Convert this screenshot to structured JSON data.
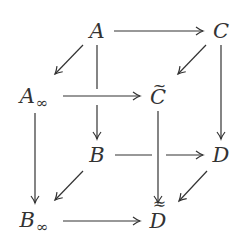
{
  "diagram": {
    "type": "commutative-cube",
    "nodes": {
      "A": {
        "label": "A",
        "x": 97,
        "y": 31
      },
      "C": {
        "label": "C",
        "x": 221,
        "y": 31
      },
      "A_inf": {
        "label": "A",
        "sub": "∞",
        "x": 32,
        "y": 96
      },
      "C_tilde": {
        "label": "C",
        "tilde": "~",
        "x": 158,
        "y": 96
      },
      "B": {
        "label": "B",
        "x": 97,
        "y": 155
      },
      "D": {
        "label": "D",
        "x": 221,
        "y": 155
      },
      "B_inf": {
        "label": "B",
        "sub": "∞",
        "x": 32,
        "y": 219
      },
      "D_tilde": {
        "label": "D",
        "tilde": "≈",
        "x": 158,
        "y": 219
      }
    },
    "edges": [
      {
        "from": "A",
        "to": "C"
      },
      {
        "from": "A",
        "to": "A_inf"
      },
      {
        "from": "A",
        "to": "B"
      },
      {
        "from": "C",
        "to": "C_tilde"
      },
      {
        "from": "C",
        "to": "D"
      },
      {
        "from": "A_inf",
        "to": "C_tilde"
      },
      {
        "from": "A_inf",
        "to": "B_inf"
      },
      {
        "from": "C_tilde",
        "to": "D_tilde"
      },
      {
        "from": "B",
        "to": "D"
      },
      {
        "from": "B",
        "to": "B_inf"
      },
      {
        "from": "D",
        "to": "D_tilde"
      },
      {
        "from": "B_inf",
        "to": "D_tilde"
      }
    ]
  }
}
